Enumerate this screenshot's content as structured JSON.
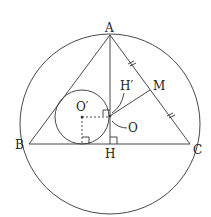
{
  "diagram": {
    "labels": {
      "A": "A",
      "B": "B",
      "C": "C",
      "H": "H",
      "M": "M",
      "O": "O",
      "O_prime": "O′",
      "H_prime": "H′"
    },
    "points": {
      "A": [
        110,
        35
      ],
      "B": [
        29,
        144
      ],
      "C": [
        190,
        144
      ],
      "H": [
        110,
        144
      ],
      "M": [
        150,
        90
      ],
      "O": [
        110,
        116
      ],
      "O_prime": [
        82,
        117
      ]
    },
    "circumcircle": {
      "cx": 110,
      "cy": 124,
      "r": 90
    },
    "incircle": {
      "cx": 82,
      "cy": 117,
      "r": 27
    },
    "annotations": [
      "tick marks on AM and MC",
      "right angle at H",
      "right angle at incircle tangency on BC",
      "right angle at H′"
    ],
    "colors": {
      "stroke": "#333333",
      "text": "#222222"
    }
  }
}
